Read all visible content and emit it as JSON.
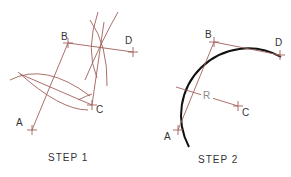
{
  "colors": {
    "construction": "#a0605a",
    "arc": "#111111",
    "label": "#333333",
    "radius_label": "#8a8a8a"
  },
  "step1": {
    "caption": "STEP 1",
    "points": {
      "A": "A",
      "B": "B",
      "C": "C",
      "D": "D"
    }
  },
  "step2": {
    "caption": "STEP 2",
    "points": {
      "A": "A",
      "B": "B",
      "C": "C",
      "D": "D"
    },
    "radius_label": "R"
  }
}
